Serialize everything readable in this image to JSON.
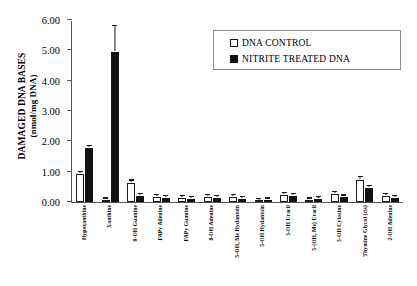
{
  "chart_data": {
    "type": "bar",
    "title": "",
    "xlabel": "",
    "ylabel": "DAMAGED DNA BASES (nmol/mg DNA)",
    "ylabel_line1": "DAMAGED DNA BASES",
    "ylabel_line2": "(nmol/mg DNA)",
    "ylim": [
      0,
      6
    ],
    "ytick_labels": [
      "6.00",
      "5.00",
      "4.00",
      "3.00",
      "2.00",
      "1.00",
      "0.00"
    ],
    "ytick_values": [
      6,
      5,
      4,
      3,
      2,
      1,
      0
    ],
    "grid": false,
    "legend_position": "top-right",
    "categories": [
      "Hypoxanthine",
      "Xanthine",
      "8-OH Guanine",
      "FAPy Adenine",
      "FAPy Guanine",
      "8-OH Adenine",
      "5-OH, Me Hydantoin",
      "5-OH Hydantoin",
      "5-OH Uracil",
      "5-(OH, Me) Uracil",
      "5-OH Cytosine",
      "Thymine Glycol (cis)",
      "2-OH Adenine"
    ],
    "series": [
      {
        "name": "DNA CONTROL",
        "color": "#ffffff",
        "values": [
          0.92,
          0.05,
          0.62,
          0.18,
          0.12,
          0.18,
          0.16,
          0.04,
          0.22,
          0.05,
          0.26,
          0.72,
          0.2
        ],
        "errors": [
          0.05,
          0.02,
          0.09,
          0.03,
          0.02,
          0.03,
          0.03,
          0.01,
          0.03,
          0.02,
          0.03,
          0.12,
          0.03
        ]
      },
      {
        "name": "NITRITE TREATED DNA",
        "color": "#111111",
        "values": [
          1.78,
          4.95,
          0.2,
          0.12,
          0.1,
          0.13,
          0.1,
          0.05,
          0.2,
          0.1,
          0.15,
          0.45,
          0.12
        ],
        "errors": [
          0.08,
          0.85,
          0.03,
          0.02,
          0.02,
          0.02,
          0.02,
          0.01,
          0.03,
          0.02,
          0.03,
          0.05,
          0.02
        ]
      }
    ]
  },
  "legend": {
    "entries": [
      {
        "label": "DNA CONTROL",
        "swatch": "hollow-square"
      },
      {
        "label": "NITRITE TREATED DNA",
        "swatch": "filled-square"
      }
    ]
  }
}
